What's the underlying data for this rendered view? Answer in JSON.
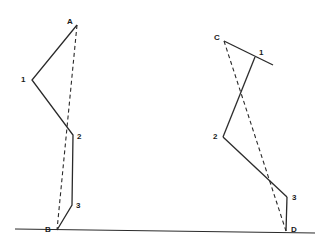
{
  "diagram": {
    "colors": {
      "line": "#2a2a2a",
      "background": "#ffffff"
    },
    "ground": {
      "x1": 15,
      "y1": 229,
      "x2": 315,
      "y2": 233
    },
    "left_figure": {
      "points": {
        "A": [
          77,
          25
        ],
        "1": [
          32,
          80
        ],
        "2": [
          73,
          135
        ],
        "3": [
          72,
          205
        ],
        "B": [
          57,
          230
        ]
      },
      "solid_path": [
        "A",
        "1",
        "2",
        "3",
        "B"
      ],
      "dashed_path": [
        "A",
        "B"
      ],
      "labels": {
        "A": {
          "text": "A",
          "x": 67,
          "y": 18
        },
        "1": {
          "text": "1",
          "x": 21,
          "y": 76
        },
        "2": {
          "text": "2",
          "x": 77,
          "y": 133
        },
        "3": {
          "text": "3",
          "x": 76,
          "y": 202
        },
        "B": {
          "text": "B",
          "x": 45,
          "y": 226
        }
      }
    },
    "right_figure": {
      "points": {
        "C": [
          224,
          41
        ],
        "1end": [
          273,
          65
        ],
        "knee": [
          255,
          57
        ],
        "2": [
          223,
          137
        ],
        "3": [
          287,
          197
        ],
        "D": [
          286,
          231
        ]
      },
      "solid_segments": [
        [
          "C",
          "1end"
        ],
        [
          "knee",
          "2"
        ],
        [
          "2",
          "3"
        ],
        [
          "3",
          "D"
        ]
      ],
      "dashed_path": [
        "C",
        "D"
      ],
      "labels": {
        "C": {
          "text": "C",
          "x": 214,
          "y": 34
        },
        "1": {
          "text": "1",
          "x": 259,
          "y": 49
        },
        "2": {
          "text": "2",
          "x": 213,
          "y": 133
        },
        "3": {
          "text": "3",
          "x": 292,
          "y": 194
        },
        "D": {
          "text": "D",
          "x": 291,
          "y": 226
        }
      }
    }
  }
}
